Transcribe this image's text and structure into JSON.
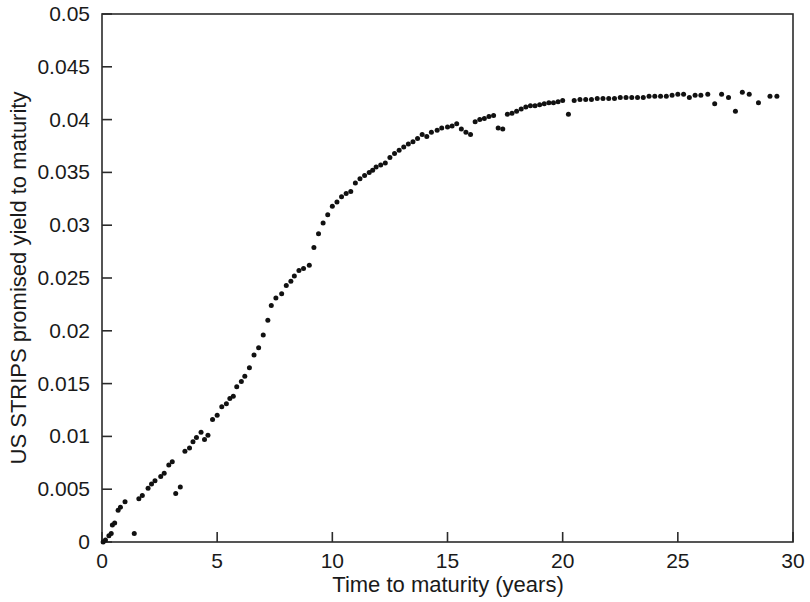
{
  "chart_data": {
    "type": "scatter",
    "title": "",
    "subtitle": "",
    "xlabel": "Time to maturity (years)",
    "ylabel": "US STRIPS promised yield to maturity",
    "xlim": [
      0,
      30
    ],
    "ylim": [
      0,
      0.05
    ],
    "xticks": [
      0,
      5,
      10,
      15,
      20,
      25,
      30
    ],
    "xticklabels": [
      "0",
      "5",
      "10",
      "15",
      "20",
      "25",
      "30"
    ],
    "yticks": [
      0,
      0.005,
      0.01,
      0.015,
      0.02,
      0.025,
      0.03,
      0.035,
      0.04,
      0.045,
      0.05
    ],
    "yticklabels": [
      "0",
      "0.005",
      "0.01",
      "0.015",
      "0.02",
      "0.025",
      "0.03",
      "0.035",
      "0.04",
      "0.045",
      "0.05"
    ],
    "grid": false,
    "legend": null,
    "legend_position": "none",
    "marker": "circle",
    "marker_color": "#111111",
    "marker_size": 5,
    "background_color": "#ffffff",
    "axes_color": "#2b2b2b",
    "annotations": [],
    "series": [
      {
        "name": "US STRIPS promised yield to maturity",
        "points": [
          [
            0.05,
            0.0
          ],
          [
            0.15,
            0.0002
          ],
          [
            0.3,
            0.0006
          ],
          [
            0.4,
            0.0008
          ],
          [
            0.45,
            0.0016
          ],
          [
            0.55,
            0.0018
          ],
          [
            0.7,
            0.003
          ],
          [
            0.8,
            0.0033
          ],
          [
            1.0,
            0.0038
          ],
          [
            1.4,
            0.0008
          ],
          [
            1.6,
            0.0041
          ],
          [
            1.75,
            0.0044
          ],
          [
            2.0,
            0.0051
          ],
          [
            2.15,
            0.0055
          ],
          [
            2.3,
            0.0058
          ],
          [
            2.55,
            0.0062
          ],
          [
            2.7,
            0.0065
          ],
          [
            2.9,
            0.0073
          ],
          [
            3.05,
            0.0076
          ],
          [
            3.2,
            0.0046
          ],
          [
            3.4,
            0.0052
          ],
          [
            3.6,
            0.0086
          ],
          [
            3.8,
            0.0089
          ],
          [
            3.95,
            0.0095
          ],
          [
            4.1,
            0.0099
          ],
          [
            4.3,
            0.0104
          ],
          [
            4.45,
            0.0097
          ],
          [
            4.6,
            0.0101
          ],
          [
            4.8,
            0.0116
          ],
          [
            5.0,
            0.012
          ],
          [
            5.2,
            0.0128
          ],
          [
            5.4,
            0.0131
          ],
          [
            5.55,
            0.0136
          ],
          [
            5.7,
            0.0138
          ],
          [
            5.85,
            0.0147
          ],
          [
            6.05,
            0.0152
          ],
          [
            6.2,
            0.0157
          ],
          [
            6.4,
            0.0165
          ],
          [
            6.6,
            0.0177
          ],
          [
            6.8,
            0.0184
          ],
          [
            7.0,
            0.0196
          ],
          [
            7.2,
            0.021
          ],
          [
            7.35,
            0.0224
          ],
          [
            7.55,
            0.0231
          ],
          [
            7.8,
            0.0235
          ],
          [
            8.0,
            0.0243
          ],
          [
            8.2,
            0.0247
          ],
          [
            8.35,
            0.0252
          ],
          [
            8.55,
            0.0257
          ],
          [
            8.75,
            0.0259
          ],
          [
            9.0,
            0.0262
          ],
          [
            9.2,
            0.0279
          ],
          [
            9.4,
            0.0292
          ],
          [
            9.6,
            0.0302
          ],
          [
            9.8,
            0.031
          ],
          [
            10.0,
            0.0318
          ],
          [
            10.2,
            0.0322
          ],
          [
            10.4,
            0.0327
          ],
          [
            10.6,
            0.033
          ],
          [
            10.8,
            0.0332
          ],
          [
            11.0,
            0.034
          ],
          [
            11.2,
            0.0344
          ],
          [
            11.4,
            0.0347
          ],
          [
            11.6,
            0.035
          ],
          [
            11.75,
            0.0352
          ],
          [
            11.9,
            0.0355
          ],
          [
            12.1,
            0.0357
          ],
          [
            12.3,
            0.0359
          ],
          [
            12.5,
            0.0364
          ],
          [
            12.7,
            0.0368
          ],
          [
            12.9,
            0.0371
          ],
          [
            13.1,
            0.0374
          ],
          [
            13.3,
            0.0377
          ],
          [
            13.5,
            0.0379
          ],
          [
            13.7,
            0.0382
          ],
          [
            13.9,
            0.0386
          ],
          [
            14.1,
            0.0384
          ],
          [
            14.3,
            0.0388
          ],
          [
            14.55,
            0.039
          ],
          [
            14.75,
            0.0392
          ],
          [
            15.0,
            0.0393
          ],
          [
            15.2,
            0.0394
          ],
          [
            15.4,
            0.0396
          ],
          [
            15.6,
            0.0391
          ],
          [
            15.8,
            0.0388
          ],
          [
            16.0,
            0.0386
          ],
          [
            16.2,
            0.0398
          ],
          [
            16.4,
            0.04
          ],
          [
            16.6,
            0.0401
          ],
          [
            16.8,
            0.0403
          ],
          [
            17.0,
            0.0404
          ],
          [
            17.2,
            0.0392
          ],
          [
            17.4,
            0.0391
          ],
          [
            17.6,
            0.0405
          ],
          [
            17.8,
            0.0406
          ],
          [
            18.0,
            0.0408
          ],
          [
            18.2,
            0.041
          ],
          [
            18.4,
            0.0412
          ],
          [
            18.6,
            0.0413
          ],
          [
            18.8,
            0.0413
          ],
          [
            19.0,
            0.0414
          ],
          [
            19.2,
            0.0415
          ],
          [
            19.4,
            0.0416
          ],
          [
            19.6,
            0.0416
          ],
          [
            19.8,
            0.0417
          ],
          [
            20.0,
            0.0418
          ],
          [
            20.25,
            0.0405
          ],
          [
            20.5,
            0.0418
          ],
          [
            20.75,
            0.0419
          ],
          [
            21.0,
            0.0419
          ],
          [
            21.25,
            0.0419
          ],
          [
            21.5,
            0.042
          ],
          [
            21.75,
            0.042
          ],
          [
            22.0,
            0.042
          ],
          [
            22.25,
            0.042
          ],
          [
            22.5,
            0.0421
          ],
          [
            22.75,
            0.0421
          ],
          [
            23.0,
            0.0421
          ],
          [
            23.25,
            0.0421
          ],
          [
            23.5,
            0.0421
          ],
          [
            23.75,
            0.0422
          ],
          [
            24.0,
            0.0422
          ],
          [
            24.25,
            0.0422
          ],
          [
            24.5,
            0.0422
          ],
          [
            24.75,
            0.0423
          ],
          [
            25.0,
            0.0424
          ],
          [
            25.25,
            0.0424
          ],
          [
            25.5,
            0.0421
          ],
          [
            25.75,
            0.0423
          ],
          [
            26.0,
            0.0423
          ],
          [
            26.3,
            0.0424
          ],
          [
            26.6,
            0.0415
          ],
          [
            26.9,
            0.0424
          ],
          [
            27.2,
            0.0421
          ],
          [
            27.5,
            0.0408
          ],
          [
            27.8,
            0.0426
          ],
          [
            28.1,
            0.0424
          ],
          [
            28.5,
            0.0416
          ],
          [
            29.0,
            0.0422
          ],
          [
            29.3,
            0.0422
          ]
        ]
      }
    ]
  }
}
